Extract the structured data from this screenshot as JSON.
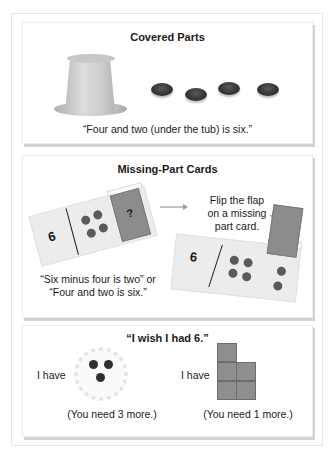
{
  "panels": {
    "covered_parts": {
      "title": "Covered Parts",
      "caption": "“Four and two (under the tub) is six.”",
      "visible_counters": 4
    },
    "missing_part_cards": {
      "title": "Missing-Part Cards",
      "left_card": {
        "number": "6",
        "dots": 4,
        "flap_label": "?"
      },
      "right_card": {
        "number": "6",
        "dots_left": 4,
        "dots_right": 2
      },
      "instruction_line1": "Flip the flap",
      "instruction_line2": "on a missing",
      "instruction_line3": "part card.",
      "caption_line1": "“Six minus four is two” or",
      "caption_line2": "“Four and two is six.”"
    },
    "wish": {
      "title": "“I wish I had 6.”",
      "left": {
        "label": "I have",
        "count": 3,
        "caption": "(You need 3 more.)"
      },
      "right": {
        "label": "I have",
        "count": 5,
        "caption": "(You need 1 more.)"
      }
    }
  },
  "colors": {
    "panel_shadow": "#d2d2d2",
    "card": "#ececec",
    "flap": "#8c8c8c",
    "counter": "#333333",
    "block": "#8e8e8e"
  }
}
